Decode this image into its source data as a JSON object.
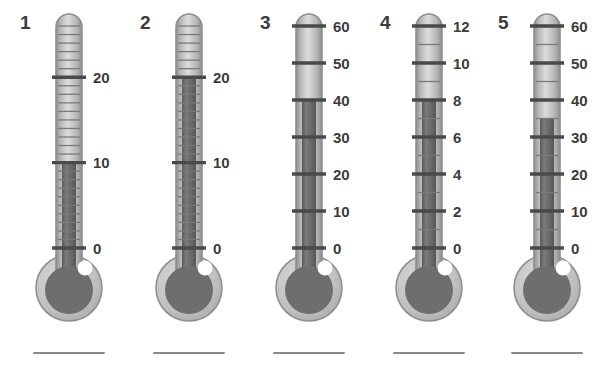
{
  "page": {
    "background_color": "#ffffff",
    "width": 597,
    "height": 375
  },
  "style": {
    "glass_light": "#cfcfcf",
    "glass_mid": "#b8b8b8",
    "glass_edge": "#8f8f8f",
    "mercury": "#6e6e6e",
    "mercury_dark": "#5f5f5f",
    "tick_color": "#4a4a4a",
    "label_color": "#3c3c3c",
    "bulb_ring": "#c2c2c2",
    "bulb_fill": "#6e6e6e",
    "highlight": "#ffffff",
    "answer_line_color": "#8a8a8a"
  },
  "chart_data": {
    "type": "bar",
    "xlabel": "Thermometer",
    "ylabel": "Temperature",
    "categories": [
      "1",
      "2",
      "3",
      "4",
      "5"
    ],
    "values": [
      10,
      20,
      40,
      8,
      35
    ],
    "series": [
      {
        "name": "Reading",
        "values": [
          10,
          20,
          40,
          8,
          35
        ]
      }
    ],
    "grid": false,
    "legend": "none",
    "annotations": [
      "Each thermometer shows a mercury column; read the value at the top of the column.",
      "An answer line is printed below every thermometer."
    ]
  },
  "thermometers": [
    {
      "index_label": "1",
      "scale_min": 0,
      "scale_max": 26,
      "label_values": [
        0,
        10,
        20
      ],
      "labels": [
        "0",
        "10",
        "20"
      ],
      "major_step": 10,
      "minor_step": 1,
      "reading": 10,
      "reading_text": "10",
      "answer_line": true
    },
    {
      "index_label": "2",
      "scale_min": 0,
      "scale_max": 26,
      "label_values": [
        0,
        10,
        20
      ],
      "labels": [
        "0",
        "10",
        "20"
      ],
      "major_step": 10,
      "minor_step": 1,
      "reading": 20,
      "reading_text": "20",
      "answer_line": true
    },
    {
      "index_label": "3",
      "scale_min": 0,
      "scale_max": 60,
      "label_values": [
        0,
        10,
        20,
        30,
        40,
        50,
        60
      ],
      "labels": [
        "0",
        "10",
        "20",
        "30",
        "40",
        "50",
        "60"
      ],
      "major_step": 10,
      "minor_step": 0,
      "reading": 40,
      "reading_text": "40",
      "answer_line": true
    },
    {
      "index_label": "4",
      "scale_min": 0,
      "scale_max": 12,
      "label_values": [
        0,
        2,
        4,
        6,
        8,
        10,
        12
      ],
      "labels": [
        "0",
        "2",
        "4",
        "6",
        "8",
        "10",
        "12"
      ],
      "major_step": 2,
      "minor_step": 1,
      "reading": 8,
      "reading_text": "8",
      "answer_line": true
    },
    {
      "index_label": "5",
      "scale_min": 0,
      "scale_max": 60,
      "label_values": [
        0,
        10,
        20,
        30,
        40,
        50,
        60
      ],
      "labels": [
        "0",
        "10",
        "20",
        "30",
        "40",
        "50",
        "60"
      ],
      "major_step": 10,
      "minor_step": 5,
      "reading": 35,
      "reading_text": "35",
      "answer_line": true
    }
  ]
}
